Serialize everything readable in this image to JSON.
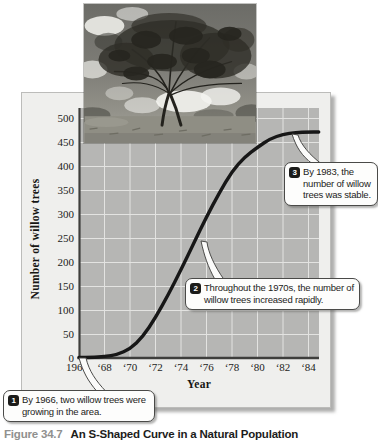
{
  "figure": {
    "caption_label": "Figure 34.7",
    "caption_text": "An S-Shaped Curve in a Natural Population"
  },
  "photo": {
    "description": "Photograph of a mature willow tree standing in a grassy field under a cloudy sky"
  },
  "chart_data": {
    "type": "line",
    "title": "",
    "xlabel": "Year",
    "ylabel": "Number of willow trees",
    "xlim": [
      1966,
      1985
    ],
    "ylim": [
      0,
      500
    ],
    "grid": true,
    "legend": "none",
    "x_tick_years": [
      1966,
      1968,
      1970,
      1972,
      1974,
      1976,
      1978,
      1980,
      1982,
      1984
    ],
    "x_tick_labels": [
      "1966",
      "‘68",
      "‘70",
      "‘72",
      "‘74",
      "‘76",
      "‘78",
      "‘80",
      "‘82",
      "‘84"
    ],
    "y_ticks": [
      0,
      50,
      100,
      150,
      200,
      250,
      300,
      350,
      400,
      450,
      500
    ],
    "series": [
      {
        "name": "Willow tree population",
        "x": [
          1966,
          1967,
          1968,
          1969,
          1970,
          1971,
          1972,
          1973,
          1974,
          1975,
          1976,
          1977,
          1978,
          1979,
          1980,
          1981,
          1982,
          1983,
          1984,
          1984.8
        ],
        "values": [
          2,
          2,
          4,
          8,
          20,
          45,
          85,
          133,
          185,
          240,
          295,
          345,
          390,
          420,
          440,
          458,
          467,
          471,
          472,
          472
        ]
      }
    ]
  },
  "callouts": [
    {
      "number": "1",
      "text": "By 1966, two willow trees were growing in the area."
    },
    {
      "number": "2",
      "text": "Throughout the 1970s, the number of willow trees increased rapidly."
    },
    {
      "number": "3",
      "text": "By 1983, the number of willow trees was stable."
    }
  ],
  "colors": {
    "curve": "#171717",
    "plot_background": "#b6b6b4",
    "gridline": "#e3e3e1",
    "axis": "#3e3e3c",
    "panel_background": "#efefed",
    "callout_border": "#4a4a48",
    "caption_label": "#90908e"
  }
}
